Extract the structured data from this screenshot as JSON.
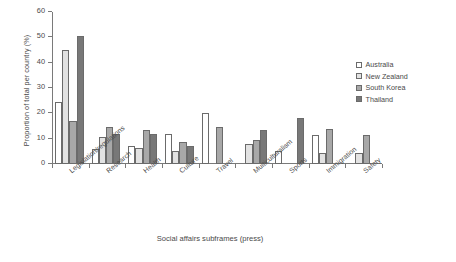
{
  "chart_data": {
    "type": "bar",
    "title": "",
    "xlabel": "Social affairs subframes (press)",
    "ylabel": "Proportion of total per country (%)",
    "ylim": [
      0,
      60
    ],
    "yticks": [
      0,
      10,
      20,
      30,
      40,
      50,
      60
    ],
    "grid": false,
    "legend_position": "right",
    "categories": [
      "Legislation/regulations",
      "Research",
      "Health",
      "Culture",
      "Travel",
      "Multiculturalism",
      "Sports",
      "Immigration",
      "Safety"
    ],
    "series": [
      {
        "name": "Australia",
        "color": "#ffffff",
        "values": [
          24.5,
          5.8,
          7.0,
          12.0,
          20.0,
          0,
          5.0,
          11.5,
          0
        ]
      },
      {
        "name": "New Zealand",
        "color": "#e2e2e2",
        "values": [
          45.0,
          10.5,
          6.3,
          5.0,
          0,
          8.0,
          0,
          4.3,
          4.5
        ]
      },
      {
        "name": "South Korea",
        "color": "#a8a8a8",
        "values": [
          17.0,
          14.5,
          13.3,
          8.5,
          14.5,
          9.5,
          0,
          14.0,
          11.5
        ]
      },
      {
        "name": "Thailand",
        "color": "#787878",
        "values": [
          50.5,
          12.0,
          12.0,
          7.0,
          0,
          13.5,
          18.0,
          0,
          0
        ]
      }
    ]
  },
  "legend": {
    "items": [
      {
        "label": "Australia"
      },
      {
        "label": "New Zealand"
      },
      {
        "label": "South Korea"
      },
      {
        "label": "Thailand"
      }
    ]
  },
  "axis": {
    "x_title": "Social affairs subframes (press)",
    "y_title": "Proportion of total per country (%)"
  }
}
